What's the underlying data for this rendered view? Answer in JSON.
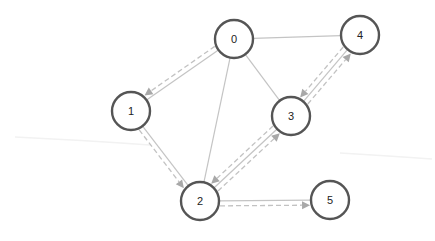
{
  "diagram": {
    "type": "directed-graph-traversal",
    "nodes": [
      {
        "id": "0",
        "label": "0"
      },
      {
        "id": "1",
        "label": "1"
      },
      {
        "id": "2",
        "label": "2"
      },
      {
        "id": "3",
        "label": "3"
      },
      {
        "id": "4",
        "label": "4"
      },
      {
        "id": "5",
        "label": "5"
      }
    ],
    "edges": [
      {
        "from": "0",
        "to": "1"
      },
      {
        "from": "0",
        "to": "2"
      },
      {
        "from": "0",
        "to": "3"
      },
      {
        "from": "0",
        "to": "4"
      },
      {
        "from": "1",
        "to": "2"
      },
      {
        "from": "2",
        "to": "3"
      },
      {
        "from": "3",
        "to": "4"
      },
      {
        "from": "2",
        "to": "5"
      }
    ],
    "traversal_arrows": [
      {
        "from": "0",
        "to": "1"
      },
      {
        "from": "1",
        "to": "2"
      },
      {
        "from": "2",
        "to": "3"
      },
      {
        "from": "3",
        "to": "2"
      },
      {
        "from": "3",
        "to": "4"
      },
      {
        "from": "4",
        "to": "3"
      },
      {
        "from": "2",
        "to": "5"
      }
    ],
    "colors": {
      "node_stroke": "#555555",
      "edge": "#c4c4c4",
      "arrow": "#a8a8a8"
    }
  }
}
